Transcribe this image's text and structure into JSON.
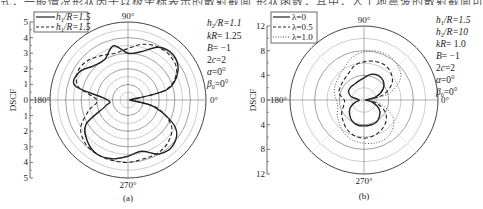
{
  "top_caption_fragment": "式，一般情况形状因子以极坐标表示的散射截面 形状函数，其中，人工地震波的散射截面可以表示为",
  "chart_data": [
    {
      "type": "polar-line",
      "panel_label": "(a)",
      "radial_axis": {
        "label": "DSCF",
        "ticks": [
          "5",
          "4",
          "3",
          "2",
          "1",
          "0",
          "1",
          "2",
          "3",
          "4",
          "5"
        ],
        "range": [
          0,
          5
        ]
      },
      "angle_labels": {
        "top": "90°",
        "left": "180°",
        "right": "0°",
        "bottom": "270°"
      },
      "legend": [
        {
          "name": "h1/R=1.5",
          "style": "solid"
        },
        {
          "name": "h1/R=1.5",
          "style": "dashed"
        }
      ],
      "params": [
        "h2/R=1.1",
        "kR= 1.25",
        "B= −1",
        "2c=2",
        "α=0°",
        "β0=0°"
      ],
      "series": [
        {
          "name": "h1/R=1.5 (solid)",
          "style": "solid",
          "theta_deg": [
            0,
            15,
            30,
            45,
            60,
            75,
            90,
            105,
            120,
            135,
            150,
            165,
            180,
            195,
            210,
            225,
            240,
            255,
            270,
            285,
            300,
            315,
            330,
            345,
            360
          ],
          "r": [
            0.1,
            2.6,
            3.7,
            4.1,
            3.9,
            3.2,
            3.0,
            3.6,
            3.0,
            3.1,
            3.6,
            3.5,
            1.3,
            1.5,
            3.1,
            3.7,
            4.0,
            3.9,
            3.6,
            3.4,
            4.0,
            4.1,
            3.5,
            1.8,
            0.1
          ]
        },
        {
          "name": "h1/R=1.5 (dashed)",
          "style": "dashed",
          "theta_deg": [
            0,
            15,
            30,
            45,
            60,
            75,
            90,
            105,
            120,
            135,
            150,
            165,
            180,
            195,
            210,
            225,
            240,
            255,
            270,
            285,
            300,
            315,
            330,
            345,
            360
          ],
          "r": [
            0.1,
            2.5,
            3.6,
            3.9,
            3.9,
            3.7,
            3.3,
            3.1,
            3.3,
            3.6,
            3.7,
            3.3,
            2.0,
            2.6,
            3.5,
            3.9,
            4.0,
            4.0,
            4.0,
            3.9,
            3.9,
            3.7,
            3.2,
            1.9,
            0.1
          ]
        }
      ]
    },
    {
      "type": "polar-line",
      "panel_label": "(b)",
      "radial_axis": {
        "label": "DSCF",
        "ticks": [
          "12",
          "8",
          "4",
          "0",
          "4",
          "8",
          "12"
        ],
        "range": [
          0,
          12
        ]
      },
      "angle_labels": {
        "top": "90°",
        "left": "180°",
        "right": "0°",
        "bottom": "270°"
      },
      "legend": [
        {
          "name": "λ=0",
          "style": "solid"
        },
        {
          "name": "λ=0.5",
          "style": "dashed"
        },
        {
          "name": "λ=1.0",
          "style": "dotted"
        }
      ],
      "params": [
        "h1/R=1.5",
        "h2/R=10",
        "kR= 1.0",
        "B= −1",
        "2c=2",
        "α=0°",
        "β0=0°"
      ],
      "series": [
        {
          "name": "λ=0",
          "style": "solid",
          "theta_deg": [
            0,
            15,
            30,
            45,
            60,
            75,
            90,
            105,
            120,
            135,
            150,
            165,
            180,
            195,
            210,
            225,
            240,
            255,
            270,
            285,
            300,
            315,
            330,
            345,
            360
          ],
          "r": [
            0.2,
            2.0,
            3.6,
            4.4,
            4.6,
            4.3,
            3.6,
            3.2,
            3.0,
            3.0,
            2.9,
            2.2,
            0.8,
            1.5,
            2.6,
            3.3,
            3.9,
            4.2,
            4.2,
            4.2,
            4.1,
            3.6,
            2.8,
            1.4,
            0.2
          ]
        },
        {
          "name": "λ=0.5",
          "style": "dashed",
          "theta_deg": [
            0,
            15,
            30,
            45,
            60,
            75,
            90,
            105,
            120,
            135,
            150,
            165,
            180,
            195,
            210,
            225,
            240,
            255,
            270,
            285,
            300,
            315,
            330,
            345,
            360
          ],
          "r": [
            0.5,
            3.2,
            5.2,
            6.2,
            6.6,
            6.5,
            6.2,
            5.8,
            5.0,
            4.6,
            4.4,
            4.2,
            3.2,
            3.4,
            4.2,
            4.8,
            5.5,
            6.0,
            6.2,
            6.0,
            5.6,
            5.0,
            4.0,
            2.2,
            0.5
          ]
        },
        {
          "name": "λ=1.0",
          "style": "dotted",
          "theta_deg": [
            0,
            15,
            30,
            45,
            60,
            75,
            90,
            105,
            120,
            135,
            150,
            165,
            180,
            195,
            210,
            225,
            240,
            255,
            270,
            285,
            300,
            315,
            330,
            345,
            360
          ],
          "r": [
            0.8,
            4.2,
            6.8,
            7.8,
            8.2,
            8.2,
            7.8,
            7.2,
            6.2,
            5.6,
            5.3,
            5.0,
            4.5,
            4.4,
            5.0,
            5.6,
            6.3,
            6.8,
            7.0,
            7.2,
            7.2,
            6.6,
            5.4,
            3.0,
            0.8
          ]
        }
      ]
    }
  ]
}
